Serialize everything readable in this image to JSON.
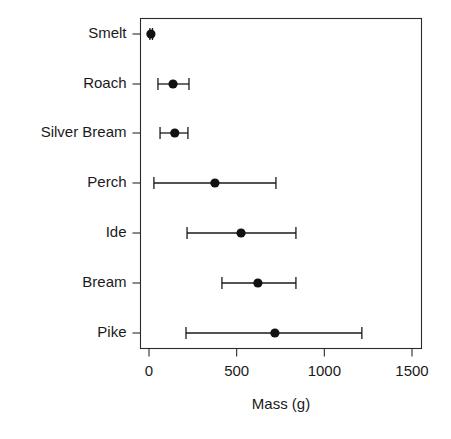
{
  "chart_data": {
    "type": "scatter",
    "title": "",
    "subtitle": "",
    "xlabel": "Mass (g)",
    "ylabel": "",
    "xlim": [
      0,
      1500
    ],
    "xticks": [
      0,
      500,
      1000,
      1500
    ],
    "xticklabels": [
      "0",
      "500",
      "1000",
      "1500"
    ],
    "grid": false,
    "legend": null,
    "orientation": "horizontal",
    "error_bar_style": "whisker-with-caps",
    "categories": [
      "Smelt",
      "Roach",
      "Silver Bream",
      "Perch",
      "Ide",
      "Bream",
      "Pike"
    ],
    "values": [
      11,
      137,
      147,
      376,
      525,
      621,
      718
    ],
    "error_low": [
      5,
      51,
      63,
      28,
      217,
      416,
      211
    ],
    "error_high": [
      20,
      228,
      222,
      724,
      838,
      838,
      1214
    ],
    "points": [
      {
        "category": "Smelt",
        "mean": 11,
        "low": 5,
        "high": 20
      },
      {
        "category": "Roach",
        "mean": 137,
        "low": 51,
        "high": 228
      },
      {
        "category": "Silver Bream",
        "mean": 147,
        "low": 63,
        "high": 222
      },
      {
        "category": "Perch",
        "mean": 376,
        "low": 28,
        "high": 724
      },
      {
        "category": "Ide",
        "mean": 525,
        "low": 217,
        "high": 838
      },
      {
        "category": "Bream",
        "mean": 621,
        "low": 416,
        "high": 838
      },
      {
        "category": "Pike",
        "mean": 718,
        "low": 211,
        "high": 1214
      }
    ],
    "colors": {
      "point": "#111111",
      "whisker": "#1a1a1a",
      "axis": "#2b2b2b",
      "background": "#ffffff",
      "text": "#1a1a1a"
    }
  }
}
